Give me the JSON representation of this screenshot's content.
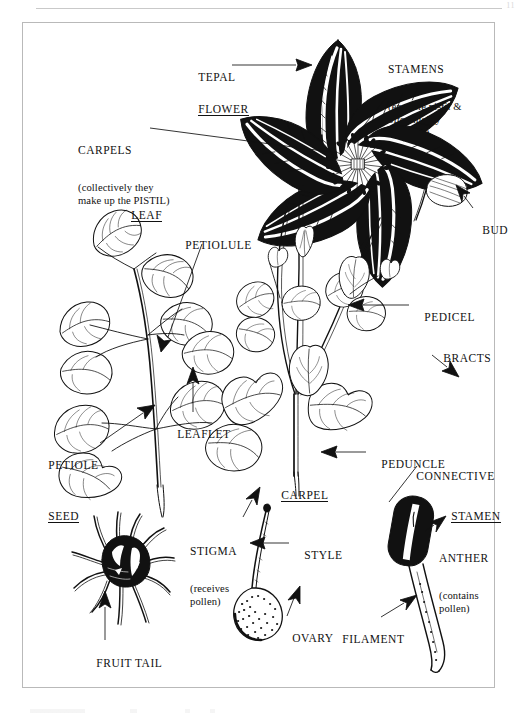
{
  "page": {
    "page_number": "11",
    "background_color": "#ffffff",
    "ink_color": "#111111",
    "frame_color": "#b9b9b9"
  },
  "labels": {
    "tepal": {
      "heading": "TEPAL",
      "detail": "",
      "underline": false
    },
    "flower": {
      "heading": "FLOWER",
      "detail": "",
      "underline": true
    },
    "stamens": {
      "heading": "STAMENS",
      "detail": "(encircle pistil &\noften highly\ncoloured)",
      "underline": false
    },
    "carpels": {
      "heading": "CARPELS",
      "detail": "(collectively they\nmake up the PISTIL)",
      "underline": false
    },
    "leaf": {
      "heading": "LEAF",
      "detail": "",
      "underline": true
    },
    "petiolule": {
      "heading": "PETIOLULE",
      "detail": "",
      "underline": false
    },
    "leaflet": {
      "heading": "LEAFLET",
      "detail": "",
      "underline": false
    },
    "petiole": {
      "heading": "PETIOLE",
      "detail": "",
      "underline": false
    },
    "bud": {
      "heading": "BUD",
      "detail": "",
      "underline": false
    },
    "pedicel": {
      "heading": "PEDICEL",
      "detail": "",
      "underline": false
    },
    "bracts": {
      "heading": "BRACTS",
      "detail": "",
      "underline": false
    },
    "peduncle": {
      "heading": "PEDUNCLE",
      "detail": "",
      "underline": false
    },
    "connective": {
      "heading": "CONNECTIVE",
      "detail": "",
      "underline": false
    },
    "seed": {
      "heading": "SEED",
      "detail": "",
      "underline": true
    },
    "fruit_tail": {
      "heading": "FRUIT TAIL",
      "detail": "",
      "underline": false
    },
    "carpel": {
      "heading": "CARPEL",
      "detail": "",
      "underline": true
    },
    "stigma": {
      "heading": "STIGMA",
      "detail": "(receives\npollen)",
      "underline": false
    },
    "style": {
      "heading": "STYLE",
      "detail": "",
      "underline": false
    },
    "ovary": {
      "heading": "OVARY",
      "detail": "",
      "underline": false
    },
    "stamen": {
      "heading": "STAMEN",
      "detail": "",
      "underline": true
    },
    "anther": {
      "heading": "ANTHER",
      "detail": "(contains\npollen)",
      "underline": false
    },
    "filament": {
      "heading": "FILAMENT",
      "detail": "",
      "underline": false
    }
  },
  "figures": [
    {
      "name": "flower",
      "caption": "FLOWER",
      "parts": [
        "TEPAL",
        "STAMENS",
        "CARPELS"
      ]
    },
    {
      "name": "leaf",
      "caption": "LEAF",
      "parts": [
        "PETIOLULE",
        "LEAFLET",
        "PETIOLE"
      ]
    },
    {
      "name": "flowering-stem",
      "caption": "",
      "parts": [
        "BUD",
        "PEDICEL",
        "BRACTS",
        "PEDUNCLE"
      ]
    },
    {
      "name": "seed",
      "caption": "SEED",
      "parts": [
        "FRUIT TAIL"
      ]
    },
    {
      "name": "carpel",
      "caption": "CARPEL",
      "parts": [
        "STIGMA",
        "STYLE",
        "OVARY"
      ]
    },
    {
      "name": "stamen",
      "caption": "STAMEN",
      "parts": [
        "CONNECTIVE",
        "ANTHER",
        "FILAMENT"
      ]
    }
  ]
}
